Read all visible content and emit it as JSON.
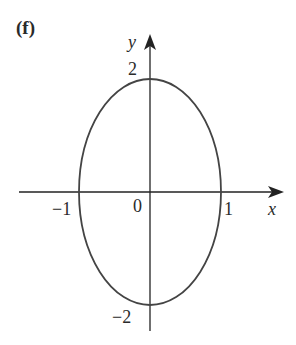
{
  "panel": {
    "label": "(f)"
  },
  "axes": {
    "x_label": "x",
    "y_label": "y",
    "x_ticks": [
      {
        "value": -1,
        "label": "−1"
      },
      {
        "value": 0,
        "label": "0"
      },
      {
        "value": 1,
        "label": "1"
      }
    ],
    "y_ticks": [
      {
        "value": 2,
        "label": "2"
      },
      {
        "value": -2,
        "label": "−2"
      }
    ]
  },
  "curve": {
    "type": "ellipse",
    "center": [
      0,
      0
    ],
    "semi_axis_x": 1,
    "semi_axis_y": 2,
    "equation": "x^2 + y^2/4 = 1",
    "color": "#444444"
  },
  "colors": {
    "axis": "#222222",
    "curve": "#444444",
    "text": "#2a2a2a"
  }
}
